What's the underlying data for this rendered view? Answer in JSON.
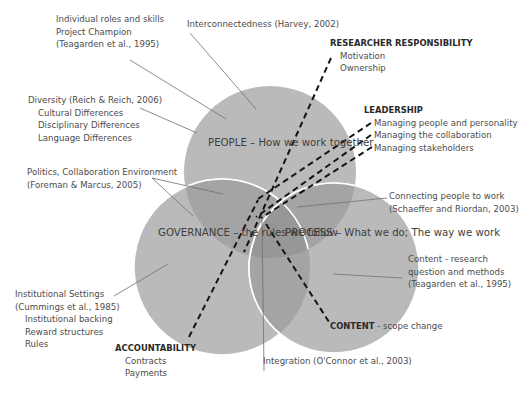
{
  "colors": {
    "circle_fill": "#b9b9b9",
    "overlap_two": "#a3a3a3",
    "overlap_three": "#969696",
    "circle_border": "#ffffff",
    "leader_line": "#7a7a7a",
    "dashed_line": "#1a1a1a",
    "text": "#4c4c4c"
  },
  "circles": {
    "people": {
      "line1": "PEOPLE – How we",
      "line2": "work together"
    },
    "governance": {
      "line1": "GOVERNANCE –",
      "line2": "the rules we",
      "line3": "follow"
    },
    "process": {
      "line1": "PROCESS –",
      "line2": "What we do; The",
      "line3": "way we work"
    }
  },
  "annotations": {
    "individual_roles": {
      "line1": "Individual roles and skills",
      "line2": "Project Champion",
      "line3": "(Teagarden et al., 1995)"
    },
    "interconnectedness": {
      "line1": "Interconnectedness (Harvey, 2002)"
    },
    "diversity": {
      "line1": "Diversity (Reich & Reich, 2006)",
      "line2": "Cultural Differences",
      "line3": "Disciplinary Differences",
      "line4": "Language Differences"
    },
    "politics": {
      "line1": "Politics, Collaboration  Environment",
      "line2": "(Foreman & Marcus, 2005)"
    },
    "connecting": {
      "line1": "Connecting people to work",
      "line2": "(Schaeffer and Riordan, 2003)"
    },
    "content_research": {
      "line1": "Content  - research",
      "line2": "question and methods",
      "line3": "(Teagarden et al., 1995)"
    },
    "institutional": {
      "line1": "Institutional Settings",
      "line2": "(Cummings et al., 1985)",
      "line3": "Institutional  backing",
      "line4": "Reward structures",
      "line5": "Rules"
    },
    "integration": {
      "line1": "Integration (O'Connor et al., 2003)"
    }
  },
  "themes": {
    "researcher_responsibility": {
      "title": "RESEARCHER RESPONSIBILITY",
      "items": [
        "Motivation",
        "Ownership"
      ]
    },
    "leadership": {
      "title": "LEADERSHIP",
      "items": [
        "Managing people and personality",
        "Managing the collaboration",
        "Managing stakeholders"
      ]
    },
    "accountability": {
      "title": "ACCOUNTABILITY",
      "items": [
        "Contracts",
        "Payments"
      ]
    },
    "content": {
      "title": "CONTENT",
      "suffix": " -  scope change"
    }
  }
}
